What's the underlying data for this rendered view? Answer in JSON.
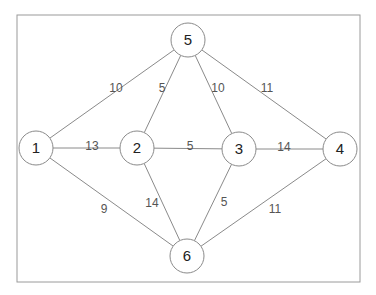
{
  "diagram": {
    "type": "weighted-undirected-graph",
    "frame": {
      "x": 17,
      "y": 15,
      "width": 343,
      "height": 267
    },
    "nodes": [
      {
        "id": "1",
        "label": "1",
        "x": 36,
        "y": 148
      },
      {
        "id": "2",
        "label": "2",
        "x": 137,
        "y": 148
      },
      {
        "id": "3",
        "label": "3",
        "x": 239,
        "y": 149
      },
      {
        "id": "4",
        "label": "4",
        "x": 340,
        "y": 149
      },
      {
        "id": "5",
        "label": "5",
        "x": 188,
        "y": 40
      },
      {
        "id": "6",
        "label": "6",
        "x": 187,
        "y": 256
      }
    ],
    "edges": [
      {
        "from": "1",
        "to": "5",
        "weight": "10",
        "lx": 116,
        "ly": 89
      },
      {
        "from": "2",
        "to": "5",
        "weight": "5",
        "lx": 162,
        "ly": 89
      },
      {
        "from": "3",
        "to": "5",
        "weight": "10",
        "lx": 218,
        "ly": 89
      },
      {
        "from": "4",
        "to": "5",
        "weight": "11",
        "lx": 267,
        "ly": 89
      },
      {
        "from": "1",
        "to": "2",
        "weight": "13",
        "lx": 92,
        "ly": 147
      },
      {
        "from": "2",
        "to": "3",
        "weight": "5",
        "lx": 190,
        "ly": 147
      },
      {
        "from": "3",
        "to": "4",
        "weight": "14",
        "lx": 284,
        "ly": 148
      },
      {
        "from": "1",
        "to": "6",
        "weight": "9",
        "lx": 104,
        "ly": 210
      },
      {
        "from": "2",
        "to": "6",
        "weight": "14",
        "lx": 152,
        "ly": 204
      },
      {
        "from": "3",
        "to": "6",
        "weight": "5",
        "lx": 224,
        "ly": 203
      },
      {
        "from": "4",
        "to": "6",
        "weight": "11",
        "lx": 275,
        "ly": 210
      }
    ],
    "node_radius": 17,
    "colors": {
      "stroke": "#8a8a8a",
      "frame": "#9a9a9a",
      "node_text": "#222222",
      "edge_text": "#555555"
    }
  }
}
